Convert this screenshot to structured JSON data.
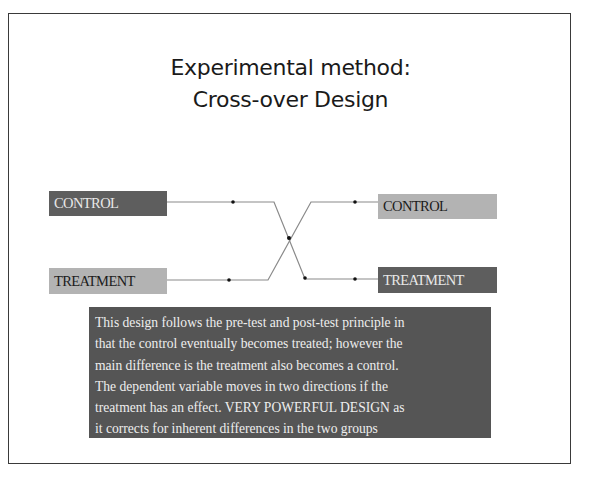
{
  "slide": {
    "title_lines": [
      "Experimental method:",
      "Cross-over Design"
    ]
  },
  "diagram": {
    "left": {
      "control_label": "CONTROL",
      "treatment_label": "TREATMENT"
    },
    "right": {
      "control_label": "CONTROL",
      "treatment_label": "TREATMENT"
    },
    "colors": {
      "dark_box": "#5e5e5e",
      "light_box": "#b3b3b3",
      "line": "#8a8a8a",
      "dot": "#111111"
    }
  },
  "description": {
    "lines": [
      "This design follows the pre-test and post-test principle in",
      "that the control eventually becomes treated; however the",
      "main difference is the treatment also becomes a control.",
      "The dependent variable moves in two directions if the",
      "treatment has an effect. VERY POWERFUL DESIGN as",
      "it corrects for inherent differences in the two groups"
    ]
  }
}
